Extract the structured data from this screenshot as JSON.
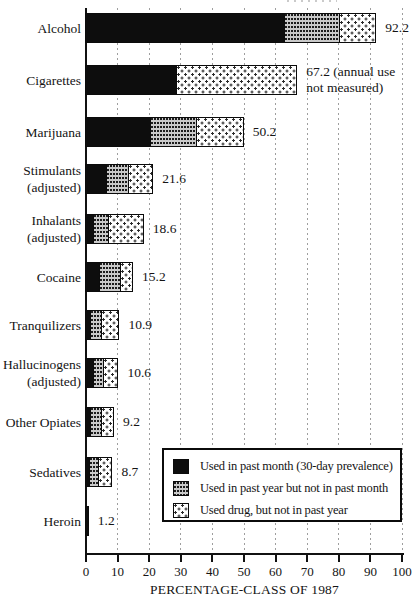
{
  "colors": {
    "ink": "#0d0d0d",
    "pattern_gray": "#c9c9c9",
    "gridline": "#9e9e9e",
    "background": "#ffffff"
  },
  "x_axis": {
    "title": "PERCENTAGE-CLASS OF 1987",
    "ticks": [
      0,
      10,
      20,
      30,
      40,
      50,
      60,
      70,
      80,
      90,
      100
    ],
    "min": 0,
    "max": 100
  },
  "legend": {
    "items": [
      {
        "key": "month",
        "label": "Used in past month (30-day prevalence)"
      },
      {
        "key": "year",
        "label": "Used in past year but not in past month"
      },
      {
        "key": "lifetime",
        "label": "Used drug, but not in past year"
      }
    ]
  },
  "chart_data": {
    "type": "bar",
    "orientation": "horizontal",
    "title": "",
    "xlabel": "PERCENTAGE-CLASS OF 1987",
    "ylabel": "",
    "xlim": [
      0,
      100
    ],
    "grid": "vertical-dashed",
    "legend_position": "bottom-right-inset",
    "categories": [
      "Alcohol",
      "Cigarettes",
      "Marijuana",
      "Stimulants\n(adjusted)",
      "Inhalants\n(adjusted)",
      "Cocaine",
      "Tranquilizers",
      "Hallucinogens\n(adjusted)",
      "Other Opiates",
      "Sedatives",
      "Heroin"
    ],
    "series": [
      {
        "name": "Used in past month (30-day prevalence)",
        "pattern": "solid-black",
        "values": [
          63.5,
          29.4,
          21.0,
          7.0,
          3.0,
          4.8,
          2.2,
          3.0,
          1.9,
          1.7,
          1.2
        ]
      },
      {
        "name": "Used in past year but not in past month",
        "pattern": "gray-stipple",
        "values": [
          17.5,
          0,
          14.5,
          7.0,
          4.8,
          6.7,
          3.2,
          3.3,
          3.5,
          2.9,
          0
        ]
      },
      {
        "name": "Used drug, but not in past year",
        "pattern": "sparse-dots",
        "values": [
          11.2,
          37.8,
          14.7,
          7.6,
          10.8,
          3.7,
          5.5,
          4.3,
          3.8,
          4.1,
          0
        ]
      }
    ],
    "totals": [
      92.2,
      67.2,
      50.2,
      21.6,
      18.6,
      15.2,
      10.9,
      10.6,
      9.2,
      8.7,
      1.2
    ],
    "value_labels": [
      "92.2",
      "67.2 (annual use\nnot measured)",
      "50.2",
      "21.6",
      "18.6",
      "15.2",
      "10.9",
      "10.6",
      "9.2",
      "8.7",
      "1.2"
    ]
  }
}
